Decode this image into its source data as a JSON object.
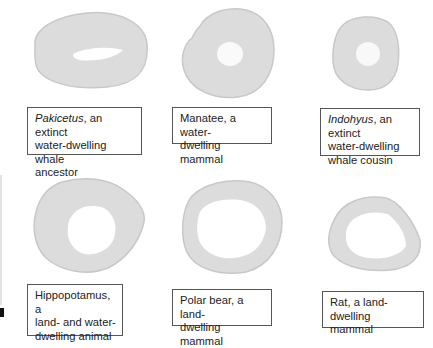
{
  "figure": {
    "panels": [
      {
        "id": "pakicetus",
        "italic": "Pakicetus",
        "rest": ", an extinct water-dwelling whale ancestor",
        "line1_i": "Pakicetus",
        "line1": ", an extinct",
        "line2": "water-dwelling whale",
        "line3": "ancestor",
        "cavity": "small"
      },
      {
        "id": "manatee",
        "line1": "Manatee, a water-",
        "line2": "dwelling mammal",
        "cavity": "tiny"
      },
      {
        "id": "indohyus",
        "line1_i": "Indohyus",
        "line1": ", an extinct",
        "line2": "water-dwelling",
        "line3": "whale cousin",
        "cavity": "tiny"
      },
      {
        "id": "hippopotamus",
        "line1": "Hippopotamus, a",
        "line2": "land- and water-",
        "line3": "dwelling animal",
        "cavity": "large"
      },
      {
        "id": "polar-bear",
        "line1": "Polar bear, a land-",
        "line2": "dwelling mammal",
        "cavity": "large"
      },
      {
        "id": "rat",
        "line1": "Rat, a land-dwelling",
        "line2": "mammal",
        "cavity": "large"
      }
    ],
    "colors": {
      "bone": "#dcdcdc",
      "bone_edge": "#c4c4c4",
      "cavity": "#ffffff",
      "caption_border": "#555555"
    }
  }
}
